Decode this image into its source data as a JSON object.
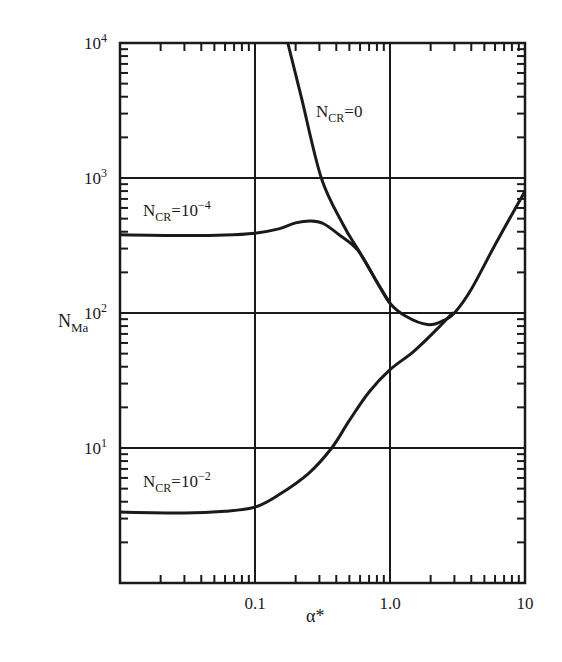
{
  "chart_data": {
    "type": "line",
    "title": "",
    "xlabel": "α*",
    "ylabel": "N_Ma",
    "xscale": "log",
    "yscale": "log",
    "xlim": [
      0.01,
      10
    ],
    "ylim": [
      1,
      10000
    ],
    "grid": true,
    "x_ticks": [
      {
        "value": 0.1,
        "label": "0.1"
      },
      {
        "value": 1.0,
        "label": "1.0"
      },
      {
        "value": 10,
        "label": "10"
      }
    ],
    "y_ticks": [
      {
        "value": 10,
        "base": "10",
        "exp": "1"
      },
      {
        "value": 100,
        "base": "10",
        "exp": "2"
      },
      {
        "value": 1000,
        "base": "10",
        "exp": "3"
      },
      {
        "value": 10000,
        "base": "10",
        "exp": "4"
      }
    ],
    "series": [
      {
        "name": "N_CR=0",
        "label_main": "N",
        "label_sub": "CR",
        "label_rest": "=0",
        "label_exp": "",
        "label_pos": [
          316,
          117
        ],
        "points": [
          [
            0.175,
            10000
          ],
          [
            0.22,
            4000
          ],
          [
            0.31,
            1000
          ],
          [
            0.45,
            450
          ],
          [
            0.58,
            295
          ],
          [
            0.8,
            170
          ],
          [
            1.0,
            118
          ],
          [
            1.3,
            95
          ],
          [
            1.9,
            82
          ],
          [
            2.5,
            88
          ],
          [
            3.0,
            100
          ],
          [
            4.0,
            150
          ],
          [
            6.0,
            320
          ],
          [
            10,
            800
          ]
        ]
      },
      {
        "name": "N_CR=10^-4",
        "label_main": "N",
        "label_sub": "CR",
        "label_rest": "=10",
        "label_exp": "−4",
        "label_pos": [
          143,
          216
        ],
        "points": [
          [
            0.01,
            380
          ],
          [
            0.03,
            375
          ],
          [
            0.06,
            378
          ],
          [
            0.1,
            390
          ],
          [
            0.15,
            420
          ],
          [
            0.2,
            465
          ],
          [
            0.26,
            480
          ],
          [
            0.32,
            460
          ],
          [
            0.42,
            380
          ],
          [
            0.58,
            290
          ],
          [
            0.8,
            170
          ],
          [
            1.0,
            118
          ]
        ]
      },
      {
        "name": "N_CR=10^-2",
        "label_main": "N",
        "label_sub": "CR",
        "label_rest": "=10",
        "label_exp": "−2",
        "label_pos": [
          143,
          487
        ],
        "points": [
          [
            0.01,
            3.35
          ],
          [
            0.03,
            3.3
          ],
          [
            0.06,
            3.4
          ],
          [
            0.1,
            3.65
          ],
          [
            0.15,
            4.5
          ],
          [
            0.25,
            6.5
          ],
          [
            0.37,
            10
          ],
          [
            0.5,
            16
          ],
          [
            0.7,
            26
          ],
          [
            1.0,
            38
          ],
          [
            1.5,
            52
          ],
          [
            2.2,
            75
          ],
          [
            2.9,
            100
          ]
        ]
      }
    ]
  }
}
